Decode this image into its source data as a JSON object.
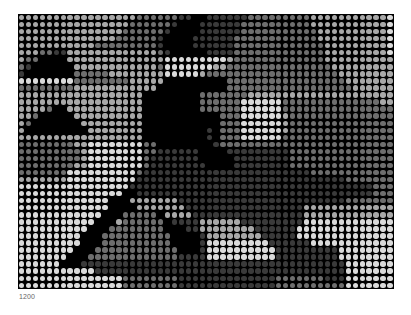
{
  "figure": {
    "caption": "1200",
    "grid": {
      "columns": 54,
      "rows": 39
    },
    "levels": {
      "0": "#000000",
      "1": "#3a3a3a",
      "2": "#6e6e6e",
      "3": "#a8a8a8",
      "4": "#dadada"
    },
    "rows": [
      "333333333333333332222221100111111222222222333333333334",
      "333333333333333322222210001111112222222222333333333334",
      "333333333333333222222100001111112222222222233333333334",
      "333333333333332222221000011111122222222222233333333334",
      "333333333332222222221000011111122222222222223333333334",
      "333221133333333333332100000111122222222222223333333334",
      "322000033333333333333444444444322222222222223333333333",
      "210000003333333333332444444433222222222222222333333333",
      "100000002222233333333444443222222222222222222233333333",
      "444444442222222233333000000000222222222222222223333333",
      "222222223333333333330000000000222222222222222222333333",
      "333333333333333333000000002222222333333333333333333333",
      "333333333333333333000000002222224444442222222222222233",
      "333320033333333333000000002222224444442222222222222222",
      "332000003333333333000000000002224444443222222222222222",
      "320000000333333333000000000002224444443222222222222222",
      "300000000033333333000000000102224444443222222222222222",
      "333333333333333333000000000102224444442222222222222222",
      "222222223344444444220000000012222222222222222222222222",
      "222222222344444444221111110000111111111222222222222222",
      "222222222344444444211111110000011111111222222222222222",
      "222222223344444444211111111000011111111222222222222222",
      "222222244444444442111111111111111111111111222222222222",
      "333333344444444441111111111111111111111111111112222222",
      "444444444444444411111111111111111111111111111111111222",
      "444444444444444001111111111111111111111111111111111222",
      "444444444444400033333331111111111111111111111112222222",
      "444444444444400003333333111111111111111113333333333333",
      "444444444444000222220333311111111111111113333333333333",
      "444444444440003222222011113333331111111114444444444444",
      "444444444400022222222000113333333311111144444444444444",
      "444444444000222222222200001333333331111144444444444444",
      "444444444000222222222200001444444444111111444444444444",
      "444444440002222222222220001444444444411111111144444444",
      "444444400022222222222221111444444444411111111144444444",
      "444444000111111111111111111111111111111111111114444444",
      "444444444441111111111111111111111111111111111114444444",
      "444444444444444222222221111111111111122222221114444444",
      "444444444444444222222221111111111111122222222224444444"
    ]
  }
}
